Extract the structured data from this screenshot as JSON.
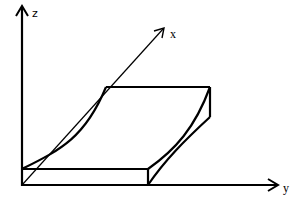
{
  "diagram": {
    "type": "3d-axes-with-curved-slab",
    "axes": {
      "z": {
        "label": "z"
      },
      "x": {
        "label": "x"
      },
      "y": {
        "label": "y"
      }
    },
    "shape": {
      "description": "Slab with a curved (concave) top-left surface lying along the y axis in 3D perspective"
    },
    "colors": {
      "stroke": "#000000",
      "background": "#ffffff"
    }
  }
}
